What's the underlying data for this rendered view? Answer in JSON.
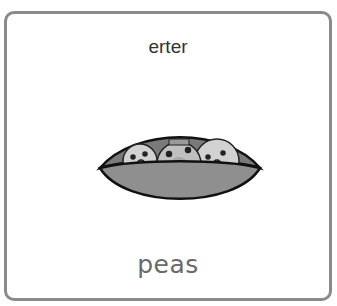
{
  "card": {
    "title": "erter",
    "label": "peas",
    "image": {
      "icon": "pea-pod-icon",
      "description": "pea pod with three smiling peas"
    }
  },
  "colors": {
    "border": "#8a8a8a",
    "title_text": "#333333",
    "label_text": "#6a6a6a",
    "pod": "#8f8f8f",
    "pea": "#c8c8c8",
    "outline": "#111111"
  }
}
